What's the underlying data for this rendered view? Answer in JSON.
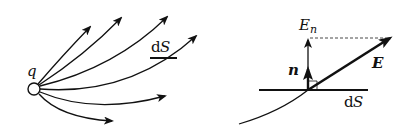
{
  "left_figure": {
    "charge_label": "q",
    "surface_label_d": "d",
    "surface_label_S": "S"
  },
  "right_figure": {
    "normal_component_label_E": "E",
    "normal_component_label_sub": "n",
    "normal_vector_label": "n",
    "field_vector_label": "E",
    "surface_label_d": "d",
    "surface_label_S": "S"
  },
  "colors": {
    "ink": "#111111",
    "background": "#ffffff"
  }
}
